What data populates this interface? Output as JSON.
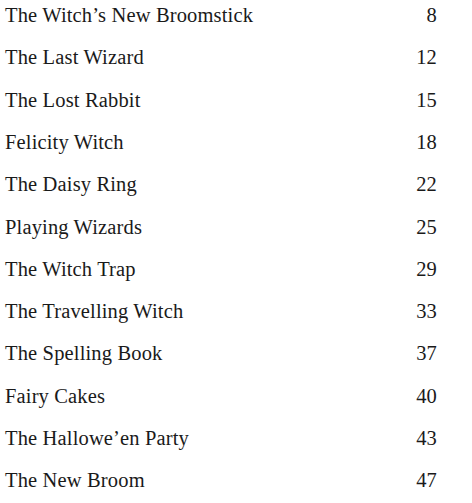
{
  "document": {
    "type": "table-of-contents",
    "background_color": "#ffffff",
    "text_color": "#1a1a1a",
    "entries": [
      {
        "title": "The Witch’s New Broomstick",
        "page": "8"
      },
      {
        "title": "The Last Wizard",
        "page": "12"
      },
      {
        "title": "The Lost Rabbit",
        "page": "15"
      },
      {
        "title": "Felicity Witch",
        "page": "18"
      },
      {
        "title": "The Daisy Ring",
        "page": "22"
      },
      {
        "title": "Playing Wizards",
        "page": "25"
      },
      {
        "title": "The Witch Trap",
        "page": "29"
      },
      {
        "title": "The Travelling Witch",
        "page": "33"
      },
      {
        "title": "The Spelling Book",
        "page": "37"
      },
      {
        "title": "Fairy Cakes",
        "page": "40"
      },
      {
        "title": "The Hallowe’en Party",
        "page": "43"
      },
      {
        "title": "The New Broom",
        "page": "47"
      }
    ]
  }
}
